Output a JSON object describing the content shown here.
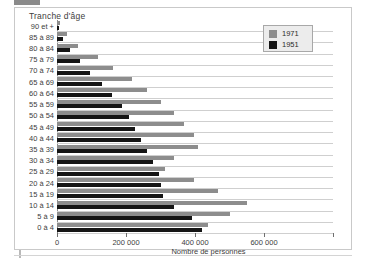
{
  "chart_data": {
    "type": "bar",
    "orientation": "horizontal",
    "title": "",
    "xlabel": "Nombre de personnes",
    "ylabel": "Tranche d'âge",
    "xlim": [
      0,
      800000
    ],
    "xticks": [
      0,
      200000,
      400000,
      600000
    ],
    "xtick_labels": [
      "0",
      "200 000",
      "400 000",
      "600 000"
    ],
    "grid": true,
    "legend_position": "top-right",
    "categories": [
      "90 et +",
      "85 à 89",
      "80 à 84",
      "75 à 79",
      "70 à 74",
      "65 à 69",
      "60 à 64",
      "55 à 59",
      "50 à 54",
      "45 à 49",
      "40 à 44",
      "35 à 39",
      "30 à 34",
      "25 à 29",
      "20 à 24",
      "15 à 19",
      "10 à 14",
      "5 à 9",
      "0 à 4"
    ],
    "series": [
      {
        "name": "1971",
        "color": "#8d8d8d",
        "values": [
          8000,
          30000,
          62000,
          118000,
          162000,
          218000,
          262000,
          300000,
          340000,
          368000,
          396000,
          410000,
          340000,
          312000,
          396000,
          468000,
          550000,
          500000,
          438000
        ]
      },
      {
        "name": "1951",
        "color": "#151515",
        "values": [
          6000,
          18000,
          38000,
          68000,
          96000,
          130000,
          160000,
          188000,
          208000,
          226000,
          244000,
          262000,
          278000,
          296000,
          300000,
          306000,
          338000,
          392000,
          420000
        ]
      }
    ]
  },
  "legend": {
    "entries": [
      {
        "label": "1971",
        "color": "#8d8d8d"
      },
      {
        "label": "1951",
        "color": "#151515"
      }
    ]
  },
  "axes": {
    "y_axis_title": "Tranche d'âge",
    "x_axis_title": "Nombre de personnes"
  }
}
